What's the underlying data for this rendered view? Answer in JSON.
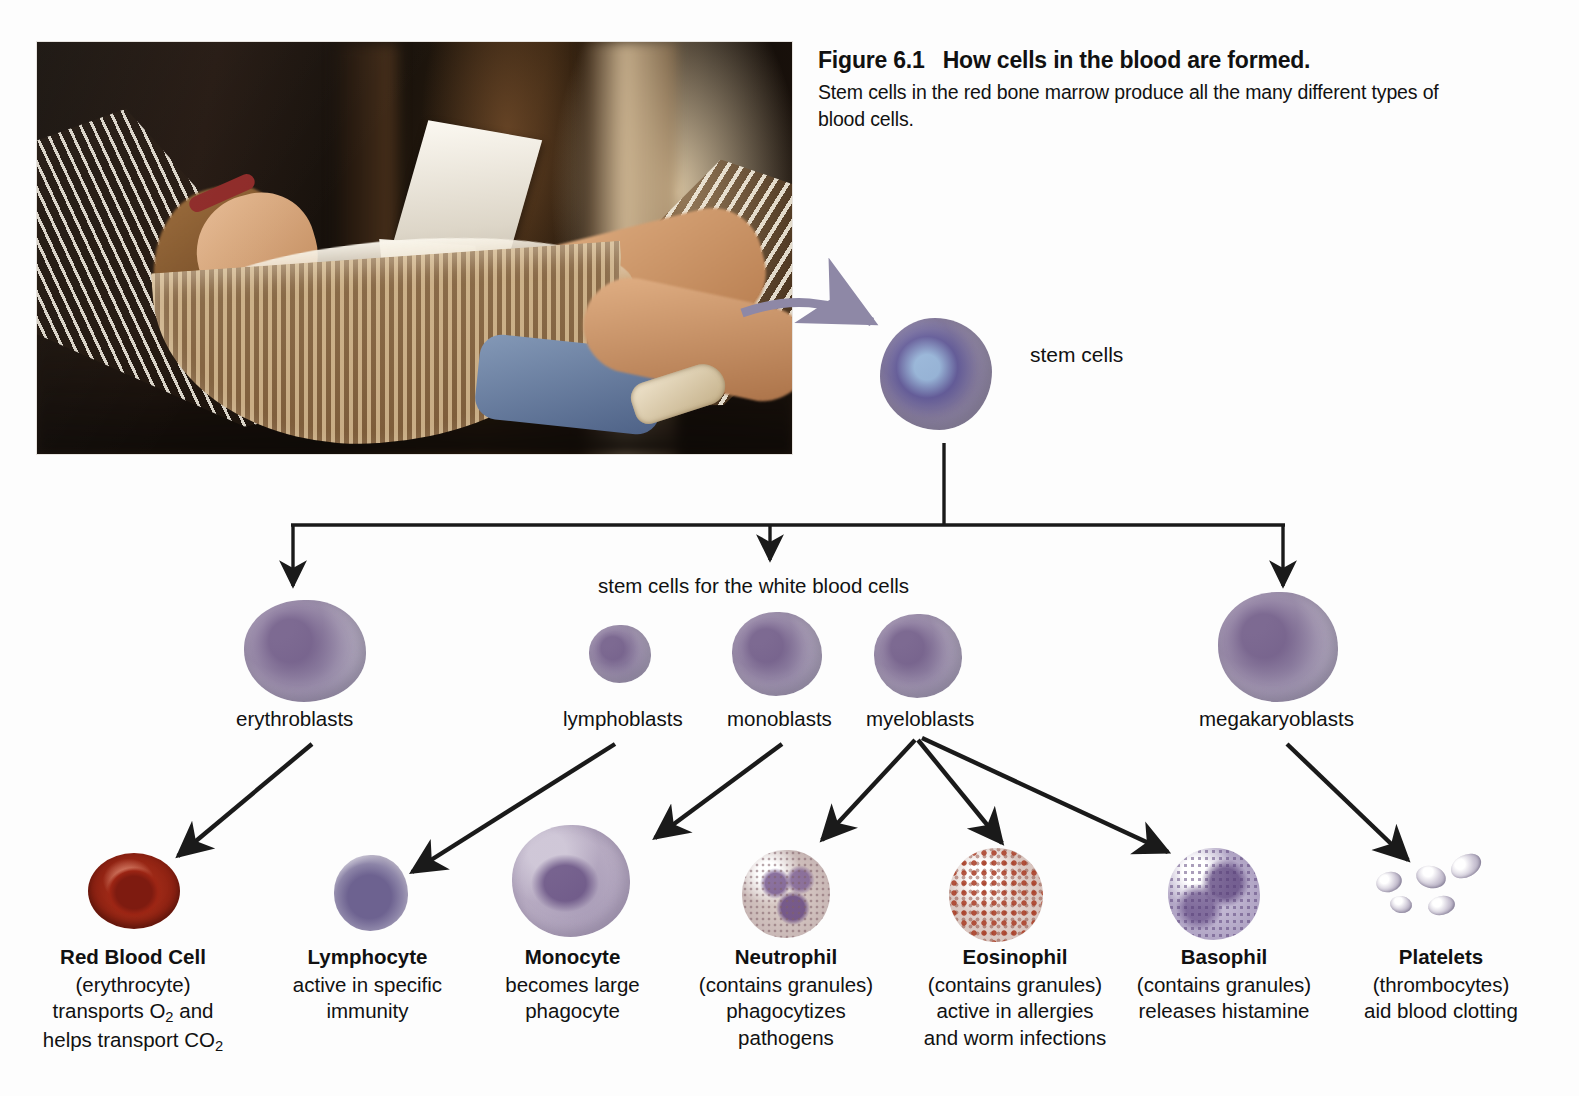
{
  "figure": {
    "number": "Figure 6.1",
    "headline": "How cells in the blood are formed.",
    "body": "Stem cells in the red bone marrow produce all the many different types of blood cells."
  },
  "photo": {
    "alt_name": "girl-reading-in-hammock-photo"
  },
  "diagram": {
    "stem_cells_label": "stem cells",
    "white_blood_stem_label": "stem cells for the white blood cells",
    "precursors": [
      {
        "id": "erythroblasts",
        "label": "erythroblasts"
      },
      {
        "id": "lymphoblasts",
        "label": "lymphoblasts"
      },
      {
        "id": "monoblasts",
        "label": "monoblasts"
      },
      {
        "id": "myeloblasts",
        "label": "myeloblasts"
      },
      {
        "id": "megakaryoblasts",
        "label": "megakaryoblasts"
      }
    ],
    "mature_cells": [
      {
        "id": "red-blood-cell",
        "name": "Red Blood Cell",
        "lines": [
          "(erythrocyte)",
          "transports O2 and",
          "helps transport CO2"
        ],
        "color": "#8c2112"
      },
      {
        "id": "lymphocyte",
        "name": "Lymphocyte",
        "lines": [
          "active in specific",
          "immunity"
        ],
        "color": "#8d85a8"
      },
      {
        "id": "monocyte",
        "name": "Monocyte",
        "lines": [
          "becomes large",
          "phagocyte"
        ],
        "color": "#b8b0c4"
      },
      {
        "id": "neutrophil",
        "name": "Neutrophil",
        "lines": [
          "(contains granules)",
          "phagocytizes",
          "pathogens"
        ],
        "color": "#c9b8b6"
      },
      {
        "id": "eosinophil",
        "name": "Eosinophil",
        "lines": [
          "(contains granules)",
          "active in allergies",
          "and worm infections"
        ],
        "color": "#a83a22"
      },
      {
        "id": "basophil",
        "name": "Basophil",
        "lines": [
          "(contains granules)",
          "releases histamine"
        ],
        "color": "#b0a4c4"
      },
      {
        "id": "platelets",
        "name": "Platelets",
        "lines": [
          "(thrombocytes)",
          "aid blood clotting"
        ],
        "color": "#cdc7d6"
      }
    ]
  },
  "colors": {
    "connector": "#1a1a1a",
    "photo_arrow": "#8e88a6",
    "background": "#fdfdfd"
  }
}
